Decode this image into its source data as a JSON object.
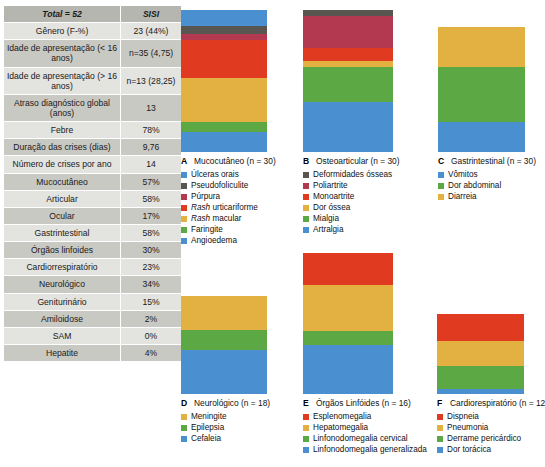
{
  "table": {
    "header": {
      "col1": "Total = 52",
      "col2": "SISI"
    },
    "rows": [
      {
        "label": "Gênero (F-%)",
        "value": "23 (44%)"
      },
      {
        "label": "Idade de apresentação (< 16 anos)",
        "value": "n=35 (4,75)"
      },
      {
        "label": "Idade de apresentação (> 16 anos)",
        "value": "n=13 (28,25)"
      },
      {
        "label": "Atraso diagnóstico global (anos)",
        "value": "13"
      },
      {
        "label": "Febre",
        "value": "78%"
      },
      {
        "label": "Duração das crises (dias)",
        "value": "9,76"
      },
      {
        "label": "Número de crises por ano",
        "value": "14"
      },
      {
        "label": "Mucocutâneo",
        "value": "57%"
      },
      {
        "label": "Articular",
        "value": "58%"
      },
      {
        "label": "Ocular",
        "value": "17%"
      },
      {
        "label": "Gastrintestinal",
        "value": "58%"
      },
      {
        "label": "Órgãos linfoides",
        "value": "30%"
      },
      {
        "label": "Cardiorrespiratório",
        "value": "23%"
      },
      {
        "label": "Neurológico",
        "value": "34%"
      },
      {
        "label": "Geniturinário",
        "value": "15%"
      },
      {
        "label": "Amiloidose",
        "value": "2%"
      },
      {
        "label": "SAM",
        "value": "0%"
      },
      {
        "label": "Hepatite",
        "value": "4%"
      }
    ]
  },
  "chart_data": [
    {
      "type": "bar",
      "panel": "A",
      "title": "Mucocutâneo (n = 30)",
      "stacked": true,
      "orientation": "vertical",
      "total": 100,
      "categories": [
        "Úlceras orais",
        "Pseudofoliculite",
        "Púrpura",
        "Rash urticariforme",
        "Rash macular",
        "Faringite",
        "Angioedema"
      ],
      "values": [
        11,
        6,
        4,
        27,
        31,
        7,
        14
      ],
      "colors": [
        "#4a8fd0",
        "#595550",
        "#b2394f",
        "#e03a20",
        "#e3b042",
        "#5ca844",
        "#4a8fd0"
      ],
      "italic_labels": [
        "Rash urticariforme",
        "Rash macular"
      ],
      "legend_position": "below"
    },
    {
      "type": "bar",
      "panel": "B",
      "title": "Osteoarticular (n = 30)",
      "stacked": true,
      "orientation": "vertical",
      "total": 100,
      "categories": [
        "Deformidades ósseas",
        "Poliartrite",
        "Monoartrite",
        "Dor óssea",
        "Mialgia",
        "Artralgia"
      ],
      "values": [
        4,
        23,
        9,
        4,
        25,
        35
      ],
      "colors": [
        "#595550",
        "#b2394f",
        "#e03a20",
        "#e3b042",
        "#5ca844",
        "#4a8fd0"
      ],
      "italic_labels": [],
      "legend_position": "below"
    },
    {
      "type": "bar",
      "panel": "C",
      "title": "Gastrintestinal (n = 30)",
      "stacked": true,
      "orientation": "vertical",
      "total": 100,
      "categories": [
        "Vômitos",
        "Dor abdominal",
        "Diarreia"
      ],
      "values": [
        24,
        44,
        32
      ],
      "colors": [
        "#4a8fd0",
        "#5ca844",
        "#e3b042"
      ],
      "stack_order": [
        "Diarreia",
        "Dor abdominal",
        "Vômitos"
      ],
      "italic_labels": [],
      "legend_position": "below"
    },
    {
      "type": "bar",
      "panel": "D",
      "title": "Neurológico (n = 18)",
      "stacked": true,
      "orientation": "vertical",
      "total": 100,
      "categories": [
        "Meningite",
        "Epilepsia",
        "Cefaleia"
      ],
      "values": [
        35,
        20,
        45
      ],
      "colors": [
        "#e3b042",
        "#5ca844",
        "#4a8fd0"
      ],
      "italic_labels": [],
      "legend_position": "below"
    },
    {
      "type": "bar",
      "panel": "E",
      "title": "Órgãos Linfóides (n = 16)",
      "stacked": true,
      "orientation": "vertical",
      "total": 100,
      "categories": [
        "Esplenomegalia",
        "Hepatomegalia",
        "Linfonodomegalia cervical",
        "Linfonodomegalia generalizada"
      ],
      "values": [
        23,
        32,
        10,
        35
      ],
      "colors": [
        "#e03a20",
        "#e3b042",
        "#5ca844",
        "#4a8fd0"
      ],
      "italic_labels": [],
      "legend_position": "below"
    },
    {
      "type": "bar",
      "panel": "F",
      "title": "Cardiorespiratório (n = 12",
      "stacked": true,
      "orientation": "vertical",
      "total": 100,
      "categories": [
        "Dispneia",
        "Pneumonia",
        "Derrame pericárdico",
        "Dor torácica"
      ],
      "values": [
        34,
        31,
        29,
        6
      ],
      "colors": [
        "#e03a20",
        "#e3b042",
        "#5ca844",
        "#4a8fd0"
      ],
      "italic_labels": [],
      "legend_position": "below"
    }
  ]
}
